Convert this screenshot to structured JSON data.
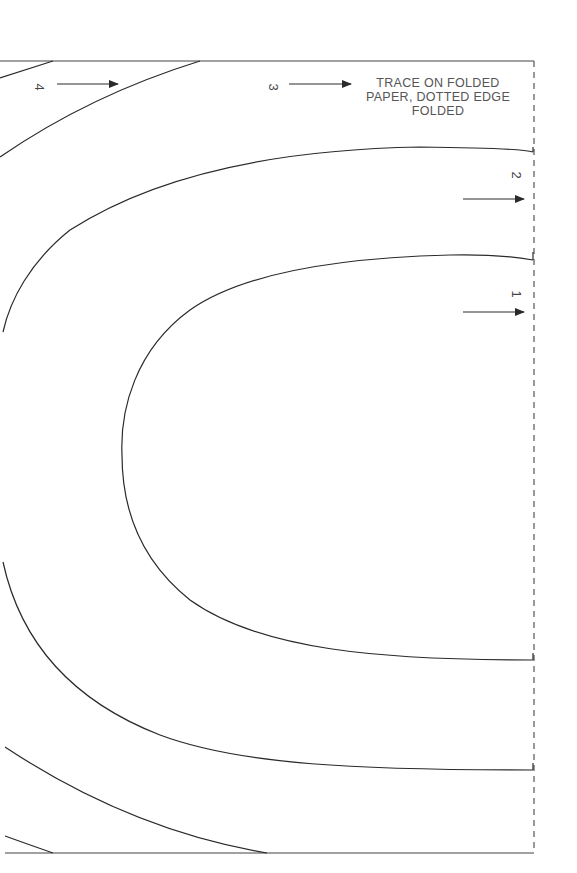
{
  "pattern": {
    "instruction_lines": [
      "TRACE ON FOLDED",
      "PAPER, DOTTED EDGE",
      "FOLDED"
    ],
    "size_labels": [
      "1",
      "2",
      "3",
      "4"
    ],
    "colors": {
      "line": "#2a2a2a",
      "text": "#555555",
      "dashed_edge": "#555555"
    }
  }
}
